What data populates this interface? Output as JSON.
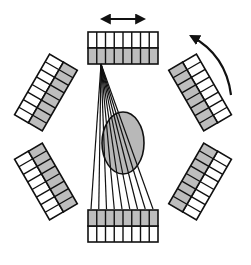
{
  "diagram": {
    "title": "",
    "center": [
      123,
      137
    ],
    "colors": {
      "background": "#ffffff",
      "stroke": "#111111",
      "crystal_inner": "#bdbdbd",
      "crystal_outer": "#ffffff",
      "object_fill": "#b8b8b8"
    },
    "detector_ring": {
      "count": 6,
      "cells_per_row": 8,
      "rows": 2,
      "inner_radius": 73,
      "outer_radius": 105,
      "width": 70,
      "angles_deg": [
        0,
        60,
        120,
        180,
        240,
        300
      ]
    },
    "object": {
      "shape": "ellipse",
      "cx": 123,
      "cy": 143,
      "rx": 21,
      "ry": 31,
      "label": ""
    },
    "fan_beam": {
      "source_detector": "top",
      "apex": [
        101,
        64
      ],
      "line_count": 9,
      "target_y": 209,
      "target_x_start": 91,
      "target_x_end": 153
    },
    "arrows": [
      {
        "name": "translation-arrow",
        "type": "double-headed",
        "from": [
          100,
          19
        ],
        "to": [
          146,
          19
        ],
        "label": ""
      },
      {
        "name": "rotation-arrow",
        "type": "curved",
        "direction": "counter-clockwise",
        "label": ""
      }
    ]
  }
}
